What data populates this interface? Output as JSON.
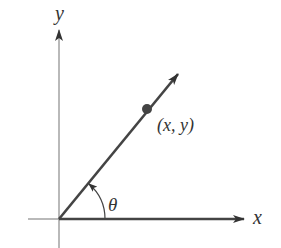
{
  "diagram": {
    "type": "polar-angle-ray",
    "colors": {
      "axis": "#8a8a8a",
      "ray": "#444444",
      "point": "#444444",
      "text": "#333333",
      "background": "#ffffff"
    },
    "axes": {
      "x_label": "x",
      "y_label": "y"
    },
    "ray": {
      "angle_label": "θ"
    },
    "point": {
      "label": "(x, y)"
    }
  }
}
